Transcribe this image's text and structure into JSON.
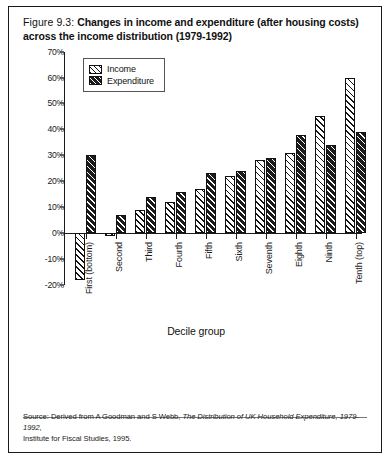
{
  "caption": {
    "figure_number": "Figure 9.3:",
    "title": "Changes in income and expenditure (after housing costs) across the income distribution (1979-1992)"
  },
  "source": {
    "line1_prefix": "Source: Derived from A Goodman and S Webb, ",
    "line1_italic": "The Distribution of UK Household Expenditure, 1979-1992,",
    "line2": "Institute for Fiscal Studies, 1995."
  },
  "chart_data": {
    "type": "bar",
    "title": "Changes in income and expenditure (after housing costs) across the income distribution (1979-1992)",
    "xlabel": "Decile group",
    "ylabel": "",
    "ylim": [
      -20,
      70
    ],
    "ytick_step": 10,
    "ytick_labels": [
      "70%",
      "60%",
      "50%",
      "40%",
      "30%",
      "20%",
      "10%",
      "0%",
      "-10%",
      "-20%"
    ],
    "ytick_values": [
      70,
      60,
      50,
      40,
      30,
      20,
      10,
      0,
      -10,
      -20
    ],
    "grid": false,
    "legend_position": "top-left",
    "categories": [
      "First (bottom)",
      "Second",
      "Third",
      "Fourth",
      "Fifth",
      "Sixth",
      "Seventh",
      "Eighth",
      "Ninth",
      "Tenth (top)"
    ],
    "series": [
      {
        "name": "Income",
        "values": [
          -18,
          -1,
          9,
          12,
          17,
          22,
          28,
          31,
          45,
          60
        ]
      },
      {
        "name": "Expenditure",
        "values": [
          30,
          7,
          14,
          16,
          23,
          24,
          29,
          38,
          34,
          39
        ]
      }
    ]
  }
}
